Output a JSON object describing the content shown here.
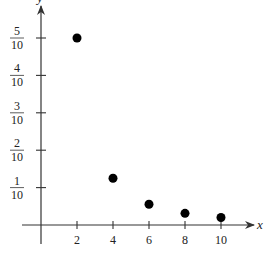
{
  "chart_data": {
    "type": "scatter",
    "title": "",
    "xlabel": "x",
    "ylabel": "y",
    "x": [
      2,
      4,
      6,
      8,
      10
    ],
    "values": [
      0.5,
      0.125,
      0.0556,
      0.03125,
      0.02
    ],
    "series": [
      {
        "name": "points",
        "x": [
          2,
          4,
          6,
          8,
          10
        ],
        "values": [
          0.5,
          0.125,
          0.0556,
          0.03125,
          0.02
        ]
      }
    ],
    "x_ticks": [
      "2",
      "4",
      "6",
      "8",
      "10"
    ],
    "y_ticks": [
      {
        "num": "1",
        "den": "10",
        "value": 0.1
      },
      {
        "num": "2",
        "den": "10",
        "value": 0.2
      },
      {
        "num": "3",
        "den": "10",
        "value": 0.3
      },
      {
        "num": "4",
        "den": "10",
        "value": 0.4
      },
      {
        "num": "5",
        "den": "10",
        "value": 0.5
      }
    ],
    "xlim": [
      0,
      11
    ],
    "ylim": [
      0,
      0.55
    ],
    "grid": false,
    "legend": "none"
  },
  "colors": {
    "axis": "#333333",
    "point": "#000000",
    "text": "#222222"
  }
}
